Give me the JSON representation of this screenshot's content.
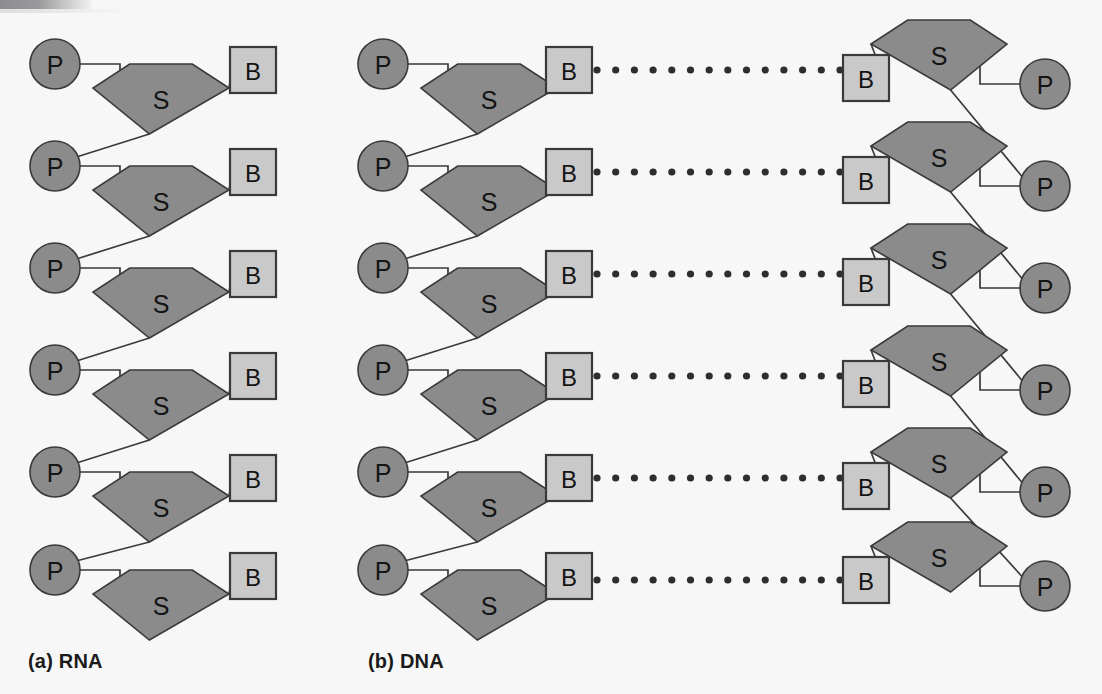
{
  "figure": {
    "background_color": "#f7f7f7"
  },
  "glyphs": {
    "phosphate": "P",
    "sugar": "S",
    "base": "B"
  },
  "colors": {
    "phosphate_fill": "#8b8b8b",
    "sugar_fill": "#8b8b8b",
    "base_fill": "#c9c9c9",
    "outline": "#3a3a3a",
    "bond": "#3a3a3a",
    "hydrogen_bond_dot": "#2e2e2e",
    "label_text": "#1a1a1a"
  },
  "panels": [
    {
      "id": "rna",
      "caption": "(a) RNA",
      "caption_x": 28,
      "caption_y": 650,
      "strands": [
        {
          "id": "rna-strand",
          "orientation": "left",
          "unit_count": 6,
          "units": [
            {
              "index": 1,
              "p": {
                "cx": 55,
                "cy": 64
              },
              "s": {
                "cx": 161,
                "cy": 96
              },
              "b": {
                "cx": 253,
                "cy": 70
              }
            },
            {
              "index": 2,
              "p": {
                "cx": 55,
                "cy": 166
              },
              "s": {
                "cx": 161,
                "cy": 198
              },
              "b": {
                "cx": 253,
                "cy": 172
              }
            },
            {
              "index": 3,
              "p": {
                "cx": 55,
                "cy": 268
              },
              "s": {
                "cx": 161,
                "cy": 300
              },
              "b": {
                "cx": 253,
                "cy": 274
              }
            },
            {
              "index": 4,
              "p": {
                "cx": 55,
                "cy": 370
              },
              "s": {
                "cx": 161,
                "cy": 402
              },
              "b": {
                "cx": 253,
                "cy": 376
              }
            },
            {
              "index": 5,
              "p": {
                "cx": 55,
                "cy": 472
              },
              "s": {
                "cx": 161,
                "cy": 504
              },
              "b": {
                "cx": 253,
                "cy": 478
              }
            },
            {
              "index": 6,
              "p": {
                "cx": 55,
                "cy": 570
              },
              "s": {
                "cx": 161,
                "cy": 602
              },
              "b": {
                "cx": 253,
                "cy": 576
              }
            }
          ]
        }
      ],
      "hydrogen_bonds": []
    },
    {
      "id": "dna",
      "caption": "(b) DNA",
      "caption_x": 368,
      "caption_y": 650,
      "strands": [
        {
          "id": "dna-strand-left",
          "orientation": "left",
          "unit_count": 6,
          "units": [
            {
              "index": 1,
              "p": {
                "cx": 383,
                "cy": 64
              },
              "s": {
                "cx": 489,
                "cy": 96
              },
              "b": {
                "cx": 569,
                "cy": 70
              }
            },
            {
              "index": 2,
              "p": {
                "cx": 383,
                "cy": 166
              },
              "s": {
                "cx": 489,
                "cy": 198
              },
              "b": {
                "cx": 569,
                "cy": 172
              }
            },
            {
              "index": 3,
              "p": {
                "cx": 383,
                "cy": 268
              },
              "s": {
                "cx": 489,
                "cy": 300
              },
              "b": {
                "cx": 569,
                "cy": 274
              }
            },
            {
              "index": 4,
              "p": {
                "cx": 383,
                "cy": 370
              },
              "s": {
                "cx": 489,
                "cy": 402
              },
              "b": {
                "cx": 569,
                "cy": 376
              }
            },
            {
              "index": 5,
              "p": {
                "cx": 383,
                "cy": 472
              },
              "s": {
                "cx": 489,
                "cy": 504
              },
              "b": {
                "cx": 569,
                "cy": 478
              }
            },
            {
              "index": 6,
              "p": {
                "cx": 383,
                "cy": 570
              },
              "s": {
                "cx": 489,
                "cy": 602
              },
              "b": {
                "cx": 569,
                "cy": 576
              }
            }
          ]
        },
        {
          "id": "dna-strand-right",
          "orientation": "right",
          "unit_count": 6,
          "units": [
            {
              "index": 1,
              "p": {
                "cx": 1045,
                "cy": 84
              },
              "s": {
                "cx": 939,
                "cy": 52
              },
              "b": {
                "cx": 866,
                "cy": 78
              }
            },
            {
              "index": 2,
              "p": {
                "cx": 1045,
                "cy": 186
              },
              "s": {
                "cx": 939,
                "cy": 154
              },
              "b": {
                "cx": 866,
                "cy": 180
              }
            },
            {
              "index": 3,
              "p": {
                "cx": 1045,
                "cy": 288
              },
              "s": {
                "cx": 939,
                "cy": 256
              },
              "b": {
                "cx": 866,
                "cy": 282
              }
            },
            {
              "index": 4,
              "p": {
                "cx": 1045,
                "cy": 390
              },
              "s": {
                "cx": 939,
                "cy": 358
              },
              "b": {
                "cx": 866,
                "cy": 384
              }
            },
            {
              "index": 5,
              "p": {
                "cx": 1045,
                "cy": 492
              },
              "s": {
                "cx": 939,
                "cy": 460
              },
              "b": {
                "cx": 866,
                "cy": 486
              }
            },
            {
              "index": 6,
              "p": {
                "cx": 1045,
                "cy": 586
              },
              "s": {
                "cx": 939,
                "cy": 554
              },
              "b": {
                "cx": 866,
                "cy": 580
              }
            }
          ]
        }
      ],
      "hydrogen_bonds": [
        {
          "index": 1,
          "y": 70,
          "x_start": 597,
          "x_end": 840,
          "dot_count": 14
        },
        {
          "index": 2,
          "y": 172,
          "x_start": 597,
          "x_end": 840,
          "dot_count": 14
        },
        {
          "index": 3,
          "y": 274,
          "x_start": 597,
          "x_end": 840,
          "dot_count": 14
        },
        {
          "index": 4,
          "y": 376,
          "x_start": 597,
          "x_end": 840,
          "dot_count": 14
        },
        {
          "index": 5,
          "y": 478,
          "x_start": 597,
          "x_end": 840,
          "dot_count": 14
        },
        {
          "index": 6,
          "y": 580,
          "x_start": 597,
          "x_end": 840,
          "dot_count": 14
        }
      ]
    }
  ],
  "geometry": {
    "p_radius": 25,
    "b_half": 23,
    "s_half_width": 68,
    "s_top_y_offset": -32,
    "s_shoulder_y_offset": -8,
    "s_bottom_y_offset": 38,
    "s_shoulder_x_ratio": 1.0,
    "hbond_dot_radius": 3.6
  }
}
